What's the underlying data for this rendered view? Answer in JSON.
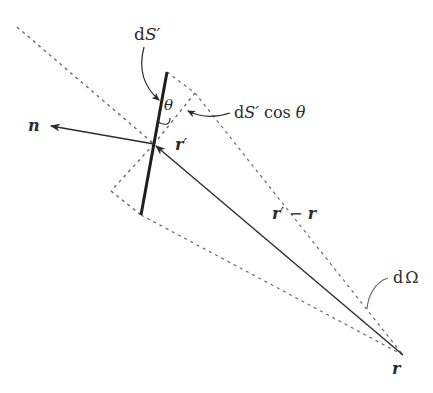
{
  "figure": {
    "colors": {
      "ink": "#2b2b2b",
      "dashed": "#6a6a6a",
      "background": "#ffffff"
    },
    "labels": {
      "surface_element": "dS′",
      "projected_area": "dS′ cos θ",
      "projected_area_d": "d",
      "projected_area_S": "S′",
      "projected_area_cos": " cos ",
      "projected_area_theta": "θ",
      "surface_d": "d",
      "surface_S": "S′",
      "angle": "θ",
      "normal": "n",
      "source_point": "r′",
      "source_r": "r",
      "source_prime": "′",
      "difference_vector": "r′ − r",
      "diff_r1": "r",
      "diff_prime": "′",
      "diff_minus": " − ",
      "diff_r2": "r",
      "solid_angle": "dΩ",
      "solid_angle_d": "d",
      "solid_angle_omega": "Ω",
      "observation_point": "r"
    },
    "points": {
      "r_prime": [
        154,
        144
      ],
      "r": [
        403,
        355
      ],
      "dS_top": [
        167,
        72
      ],
      "dS_bottom": [
        141,
        215
      ],
      "n_tip": [
        50,
        126
      ]
    }
  }
}
